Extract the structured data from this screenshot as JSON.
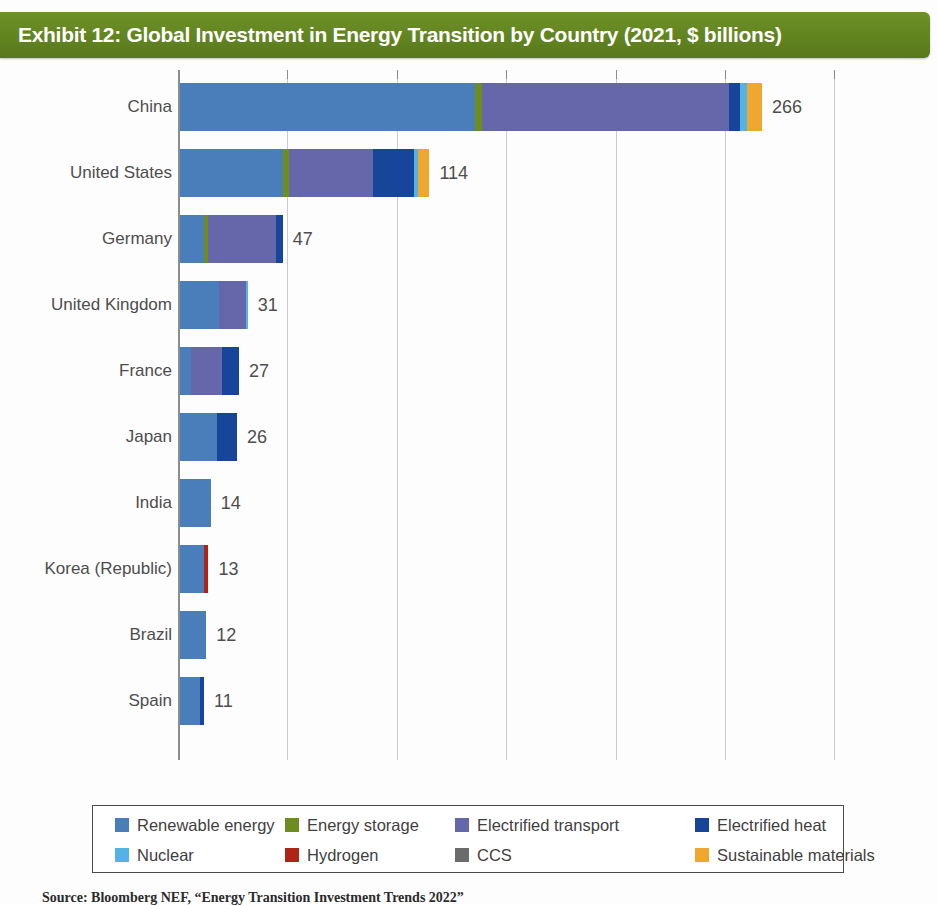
{
  "exhibit": {
    "title": "Exhibit 12: Global Investment in Energy Transition by Country (2021, $ billions)",
    "banner_color": "#628420",
    "source": "Source: Bloomberg NEF, “Energy Transition Investment Trends 2022”"
  },
  "chart_data": {
    "type": "bar",
    "orientation": "horizontal",
    "stacked": true,
    "title": "Exhibit 12: Global Investment in Energy Transition by Country (2021, $ billions)",
    "xlabel": "",
    "ylabel": "",
    "xlim": [
      0,
      300
    ],
    "xticks": [
      0,
      50,
      100,
      150,
      200,
      250,
      300
    ],
    "grid": "vertical",
    "legend_position": "bottom",
    "unit": "$ billions",
    "categories": [
      "China",
      "United States",
      "Germany",
      "United Kingdom",
      "France",
      "Japan",
      "India",
      "Korea (Republic)",
      "Brazil",
      "Spain"
    ],
    "totals": [
      266,
      114,
      47,
      31,
      27,
      26,
      14,
      13,
      12,
      11
    ],
    "total_labels": [
      "266",
      "114",
      "47",
      "31",
      "27",
      "26",
      "14",
      "13",
      "12",
      "11"
    ],
    "series": [
      {
        "name": "Renewable energy",
        "color": "#4a7ebb",
        "values": [
          135,
          47,
          11,
          18,
          5,
          17,
          14,
          11,
          12,
          9
        ]
      },
      {
        "name": "Energy storage",
        "color": "#6f8c1e",
        "values": [
          3,
          3,
          2,
          0,
          0,
          0,
          0,
          0,
          0,
          0
        ]
      },
      {
        "name": "Electrified transport",
        "color": "#6667ab",
        "values": [
          113,
          38,
          31,
          12,
          14,
          0,
          0,
          0,
          0,
          0
        ]
      },
      {
        "name": "Electrified heat",
        "color": "#17459a",
        "values": [
          5,
          19,
          3,
          0,
          8,
          9,
          0,
          0,
          0,
          2
        ]
      },
      {
        "name": "Nuclear",
        "color": "#52b3e4",
        "values": [
          3,
          2,
          0,
          1,
          0,
          0,
          0,
          0,
          0,
          0
        ]
      },
      {
        "name": "Hydrogen",
        "color": "#b02418",
        "values": [
          0,
          0,
          0,
          0,
          0,
          0,
          0,
          2,
          0,
          0
        ]
      },
      {
        "name": "CCS",
        "color": "#6b6b6b",
        "values": [
          0,
          0,
          0,
          0,
          0,
          0,
          0,
          0,
          0,
          0
        ]
      },
      {
        "name": "Sustainable materials",
        "color": "#efa730",
        "values": [
          7,
          5,
          0,
          0,
          0,
          0,
          0,
          0,
          0,
          0
        ]
      }
    ]
  },
  "legend": {
    "items": [
      {
        "label": "Renewable energy",
        "color": "#4a7ebb"
      },
      {
        "label": "Energy storage",
        "color": "#6f8c1e"
      },
      {
        "label": "Electrified transport",
        "color": "#6667ab"
      },
      {
        "label": "Electrified heat",
        "color": "#17459a"
      },
      {
        "label": "Nuclear",
        "color": "#52b3e4"
      },
      {
        "label": "Hydrogen",
        "color": "#b02418"
      },
      {
        "label": "CCS",
        "color": "#6b6b6b"
      },
      {
        "label": "Sustainable materials",
        "color": "#efa730"
      }
    ]
  }
}
